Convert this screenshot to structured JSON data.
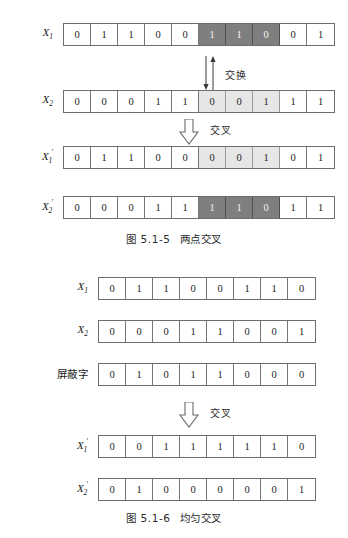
{
  "figures": [
    {
      "id": "two-point-crossover",
      "caption_number": "图 5.1-5",
      "caption_title": "两点交叉",
      "swap_label": "交换",
      "cross_label": "交叉",
      "rows": [
        {
          "label_base": "X",
          "label_sub": "1",
          "label_prime": "",
          "label_text": "X1",
          "bits": [
            "0",
            "1",
            "1",
            "0",
            "0",
            "1",
            "1",
            "0",
            "0",
            "1"
          ],
          "highlight": [
            "none",
            "none",
            "none",
            "none",
            "none",
            "dark",
            "dark",
            "dark",
            "none",
            "none"
          ]
        },
        {
          "label_base": "X",
          "label_sub": "2",
          "label_prime": "",
          "label_text": "X2",
          "bits": [
            "0",
            "0",
            "0",
            "1",
            "1",
            "0",
            "0",
            "1",
            "1",
            "1"
          ],
          "highlight": [
            "none",
            "none",
            "none",
            "none",
            "none",
            "light",
            "light",
            "light",
            "none",
            "none"
          ]
        },
        {
          "label_base": "X",
          "label_sub": "1",
          "label_prime": "′",
          "label_text": "X1′",
          "bits": [
            "0",
            "1",
            "1",
            "0",
            "0",
            "0",
            "0",
            "1",
            "0",
            "1"
          ],
          "highlight": [
            "none",
            "none",
            "none",
            "none",
            "none",
            "light",
            "light",
            "light",
            "none",
            "none"
          ]
        },
        {
          "label_base": "X",
          "label_sub": "2",
          "label_prime": "′",
          "label_text": "X2′",
          "bits": [
            "0",
            "0",
            "0",
            "1",
            "1",
            "1",
            "1",
            "0",
            "1",
            "1"
          ],
          "highlight": [
            "none",
            "none",
            "none",
            "none",
            "none",
            "dark",
            "dark",
            "dark",
            "none",
            "none"
          ]
        }
      ]
    },
    {
      "id": "uniform-crossover",
      "caption_number": "图 5.1-6",
      "caption_title": "均匀交叉",
      "cross_label": "交叉",
      "rows": [
        {
          "label_base": "X",
          "label_sub": "1",
          "label_prime": "",
          "label_text": "X1",
          "bits": [
            "0",
            "1",
            "1",
            "0",
            "0",
            "1",
            "1",
            "0"
          ],
          "highlight": [
            "none",
            "none",
            "none",
            "none",
            "none",
            "none",
            "none",
            "none"
          ]
        },
        {
          "label_base": "X",
          "label_sub": "2",
          "label_prime": "",
          "label_text": "X2",
          "bits": [
            "0",
            "0",
            "0",
            "1",
            "1",
            "0",
            "0",
            "1"
          ],
          "highlight": [
            "none",
            "none",
            "none",
            "none",
            "none",
            "none",
            "none",
            "none"
          ]
        },
        {
          "label_base": "",
          "label_sub": "",
          "label_prime": "",
          "label_text": "屏蔽字",
          "bits": [
            "0",
            "1",
            "0",
            "1",
            "1",
            "0",
            "0",
            "0"
          ],
          "highlight": [
            "none",
            "none",
            "none",
            "none",
            "none",
            "none",
            "none",
            "none"
          ]
        },
        {
          "label_base": "X",
          "label_sub": "1",
          "label_prime": "′",
          "label_text": "X1′",
          "bits": [
            "0",
            "0",
            "1",
            "1",
            "1",
            "1",
            "1",
            "0"
          ],
          "highlight": [
            "none",
            "none",
            "none",
            "none",
            "none",
            "none",
            "none",
            "none"
          ]
        },
        {
          "label_base": "X",
          "label_sub": "2",
          "label_prime": "′",
          "label_text": "X2′",
          "bits": [
            "0",
            "1",
            "0",
            "0",
            "0",
            "0",
            "0",
            "1"
          ],
          "highlight": [
            "none",
            "none",
            "none",
            "none",
            "none",
            "none",
            "none",
            "none"
          ]
        }
      ]
    }
  ],
  "colors": {
    "dark_highlight": "#7f7f7f",
    "light_highlight": "#e6e6e6",
    "cell_border": "#777777",
    "strip_border": "#6e6e6e",
    "text": "#1d1d1d",
    "page_background": "#ffffff"
  }
}
